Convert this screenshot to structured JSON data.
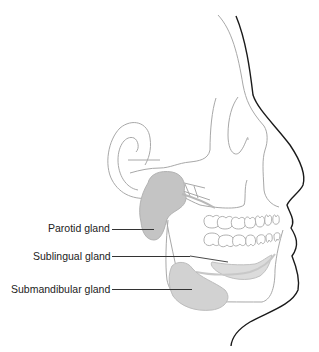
{
  "colors": {
    "outline_skull": "#a8a8a8",
    "outline_profile": "#1a1a1a",
    "gland_fill": "#c4c4c4",
    "gland_light": "#dcdcdc",
    "leader": "#333333",
    "text": "#222222"
  },
  "labels": [
    {
      "id": "parotid",
      "text": "Parotid gland"
    },
    {
      "id": "sublingual",
      "text": "Sublingual gland"
    },
    {
      "id": "submandibular",
      "text": "Submandibular gland"
    }
  ]
}
